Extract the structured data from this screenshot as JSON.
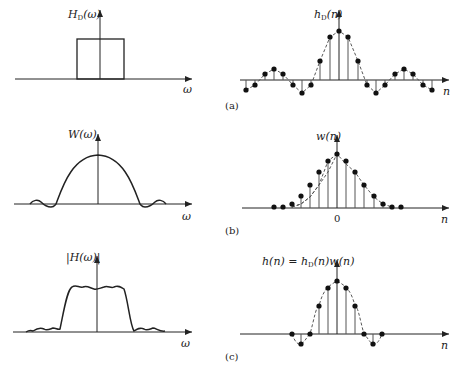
{
  "figure": {
    "panels": [
      {
        "id": "a",
        "caption": "(a)",
        "left": {
          "ylabel_main": "H",
          "ylabel_sub": "D",
          "ylabel_arg": "(ω)",
          "xlabel": "ω",
          "shape": "ideal-rectangular-lowpass"
        },
        "right": {
          "ylabel_main": "h",
          "ylabel_sub": "D",
          "ylabel_arg": "(n)",
          "xlabel": "n",
          "shape": "sinc-impulse-response",
          "samples": [
            -0.3,
            -0.18,
            0.12,
            0.25,
            0.12,
            -0.18,
            -0.36,
            -0.18,
            0.4,
            0.9,
            1.0,
            0.9,
            0.4,
            -0.18,
            -0.36,
            -0.18,
            0.12,
            0.25,
            0.12,
            -0.18,
            -0.3
          ]
        }
      },
      {
        "id": "b",
        "caption": "(b)",
        "left": {
          "ylabel_main": "W",
          "ylabel_arg": "(ω)",
          "xlabel": "ω",
          "shape": "window-spectrum"
        },
        "right": {
          "ylabel_main": "w",
          "ylabel_arg": "(n)",
          "xlabel": "n",
          "origin_tick": "0",
          "shape": "window-sequence",
          "samples": [
            0.0,
            0.0,
            0.06,
            0.2,
            0.4,
            0.63,
            0.86,
            1.0,
            0.86,
            0.63,
            0.4,
            0.2,
            0.06,
            0.0,
            0.0
          ]
        }
      },
      {
        "id": "c",
        "caption": "(c)",
        "left": {
          "ylabel": "|H(ω)|",
          "xlabel": "ω",
          "shape": "windowed-filter-response"
        },
        "right": {
          "ylabel_main": "h(n) = h",
          "ylabel_sub": "D",
          "ylabel_tail": "(n)w(n)",
          "xlabel": "n",
          "shape": "windowed-impulse-response",
          "samples": [
            0.0,
            -0.3,
            0.0,
            0.5,
            0.9,
            1.0,
            0.9,
            0.5,
            0.0,
            -0.3,
            0.0
          ]
        }
      }
    ]
  }
}
